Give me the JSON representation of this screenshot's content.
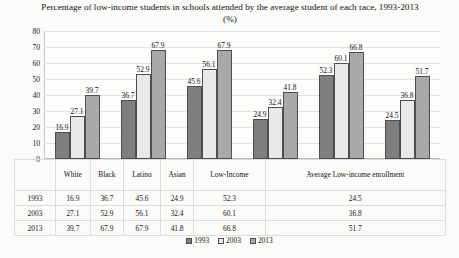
{
  "chart_data": {
    "type": "bar",
    "title": "Percentage of low-income students in schools attended by the average student of each race, 1993-2013 (%)",
    "xlabel": "",
    "ylabel": "",
    "ylim": [
      0,
      80
    ],
    "ytick_step": 10,
    "yticks": [
      "80",
      "70",
      "60",
      "50",
      "40",
      "30",
      "20",
      "10",
      "0"
    ],
    "grid": true,
    "legend_position": "bottom",
    "categories": [
      "White",
      "Black",
      "Latino",
      "Asian",
      "Low-Income",
      "Average Low-income enrollment"
    ],
    "series": [
      {
        "name": "1993",
        "color": "#7e7e7e",
        "values": [
          16.9,
          36.7,
          45.6,
          24.9,
          52.3,
          24.5
        ]
      },
      {
        "name": "2003",
        "color": "#e9e9e7",
        "values": [
          27.1,
          52.9,
          56.1,
          32.4,
          60.1,
          36.8
        ]
      },
      {
        "name": "2013",
        "color": "#a9a9a9",
        "values": [
          39.7,
          67.9,
          67.9,
          41.8,
          66.8,
          51.7
        ]
      }
    ],
    "data_labels": [
      [
        "16.9",
        "27.1",
        "39.7"
      ],
      [
        "36.7",
        "52.9",
        "67.9"
      ],
      [
        "45.6",
        "56.1",
        "67.9"
      ],
      [
        "24.9",
        "32.4",
        "41.8"
      ],
      [
        "52.3",
        "60.1",
        "66.8"
      ],
      [
        "24.5",
        "36.8",
        "51.7"
      ]
    ]
  },
  "table": {
    "corner_label": "",
    "columns": [
      "White",
      "Black",
      "Latino",
      "Asian",
      "Low-Income",
      "Average Low-income enrollment"
    ],
    "rows": [
      {
        "year": "1993",
        "values": [
          "16.9",
          "36.7",
          "45.6",
          "24.9",
          "52.3",
          "24.5"
        ]
      },
      {
        "year": "2003",
        "values": [
          "27.1",
          "52.9",
          "56.1",
          "32.4",
          "60.1",
          "36.8"
        ]
      },
      {
        "year": "2013",
        "values": [
          "39.7",
          "67.9",
          "67.9",
          "41.8",
          "66.8",
          "51.7"
        ]
      }
    ]
  },
  "legend": {
    "items": [
      {
        "label": "1993"
      },
      {
        "label": "2003"
      },
      {
        "label": "2013"
      }
    ]
  }
}
